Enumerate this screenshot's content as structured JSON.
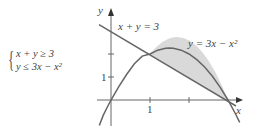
{
  "system": {
    "line1": "x + y ≥ 3",
    "line2": "y ≤ 3x − x²"
  },
  "graph": {
    "x_axis_label": "x",
    "y_axis_label": "y",
    "x_tick_label": "1",
    "y_tick_label": "1",
    "line_label": "x + y = 3",
    "parabola_label": "y = 3x − x²"
  },
  "colors": {
    "curve": "#666666",
    "axis": "#666666",
    "shade": "#d9d9d9",
    "text": "#444444"
  }
}
